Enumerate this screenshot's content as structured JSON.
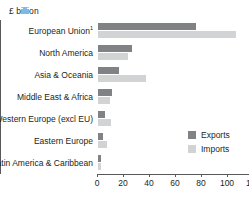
{
  "chart_data": {
    "type": "bar",
    "orientation": "horizontal",
    "title": "£ billion",
    "xlabel": "",
    "ylabel": "",
    "xlim": [
      0,
      120
    ],
    "xticks": [
      0,
      20,
      40,
      60,
      80,
      100,
      120
    ],
    "grid": false,
    "legend_position": "middle-right",
    "categories": [
      "European Union",
      "North America",
      "Asia & Oceania",
      "Middle East & Africa",
      "Western Europe (excl EU)",
      "Eastern Europe",
      "Latin America & Caribbean"
    ],
    "category_footnotes": [
      "1",
      "",
      "",
      "",
      "",
      "",
      ""
    ],
    "series": [
      {
        "name": "Exports",
        "color": "#808285",
        "values": [
          75,
          26,
          16,
          11,
          5,
          4,
          2
        ]
      },
      {
        "name": "Imports",
        "color": "#d1d3d4",
        "values": [
          106,
          23,
          37,
          9,
          10,
          7,
          2
        ]
      }
    ]
  },
  "legend": {
    "items": [
      {
        "label": "Exports",
        "color": "#808285"
      },
      {
        "label": "Imports",
        "color": "#d1d3d4"
      }
    ]
  }
}
